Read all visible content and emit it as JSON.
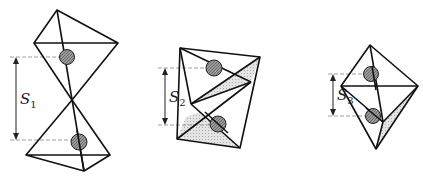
{
  "figures": [
    {
      "id": "fig1",
      "label": "S",
      "subscript": "1",
      "description": "two tetrahedra joined apex-to-apex (hourglass), balls at separation S1"
    },
    {
      "id": "fig2",
      "label": "S",
      "subscript": "2",
      "description": "two tetrahedra joined edge-to-edge with shaded faces, balls at separation S2"
    },
    {
      "id": "fig3",
      "label": "S",
      "subscript": "3",
      "description": "two tetrahedra joined face-to-face (bipyramid), balls at separation S3"
    }
  ],
  "colors": {
    "line": "#111111",
    "ball": "#8a8a8a",
    "shade": "#d8d8d8",
    "dash": "#888888"
  }
}
